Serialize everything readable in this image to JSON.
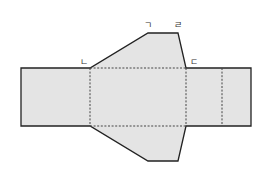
{
  "diagram": {
    "type": "prism-net",
    "fill": "#e4e4e4",
    "stroke": "#222222",
    "fold_stroke": "#444444",
    "labels": {
      "top_left": "ㄱ",
      "top_right": "ㄹ",
      "mid_left": "ㄴ",
      "mid_right": "ㄷ"
    },
    "faces": [
      {
        "name": "left-rectangle",
        "points": "21,68 90,68 90,126 21,126"
      },
      {
        "name": "center-rectangle",
        "points": "90,68 186,68 186,126 90,126"
      },
      {
        "name": "right-rectangle-1",
        "points": "186,68 222,68 222,126 186,126"
      },
      {
        "name": "right-rectangle-2",
        "points": "222,68 251,68 251,126 222,126"
      },
      {
        "name": "top-trapezoid",
        "points": "90,68 148,33 178,33 186,68"
      },
      {
        "name": "bottom-trapezoid",
        "points": "90,126 148,161 178,161 186,126"
      }
    ]
  }
}
